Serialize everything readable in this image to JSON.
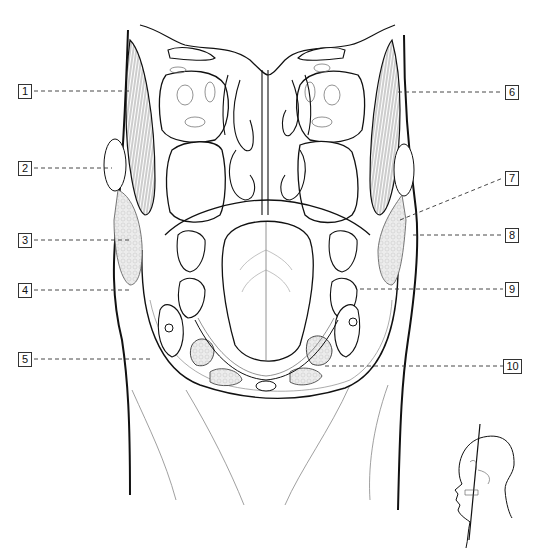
{
  "diagram": {
    "type": "anatomical-cross-section",
    "view": "coronal section of head (nasal cavity, maxillary sinuses, oral cavity/tongue, neck)",
    "colors": {
      "line": "#111111",
      "thin_line": "#555555",
      "fat_fill": "#e6e6e6",
      "background": "#ffffff"
    },
    "labels_left": [
      {
        "id": "1",
        "number": "1",
        "y": 91
      },
      {
        "id": "2",
        "number": "2",
        "y": 168
      },
      {
        "id": "3",
        "number": "3",
        "y": 240
      },
      {
        "id": "4",
        "number": "4",
        "y": 290
      },
      {
        "id": "5",
        "number": "5",
        "y": 359
      }
    ],
    "labels_right": [
      {
        "id": "6",
        "number": "6",
        "y": 92
      },
      {
        "id": "7",
        "number": "7",
        "y": 178
      },
      {
        "id": "8",
        "number": "8",
        "y": 235
      },
      {
        "id": "9",
        "number": "9",
        "y": 289
      },
      {
        "id": "10",
        "number": "10",
        "y": 366
      }
    ],
    "orientation_inset": {
      "description": "lateral head silhouette with skull and vertical section plane line"
    }
  }
}
